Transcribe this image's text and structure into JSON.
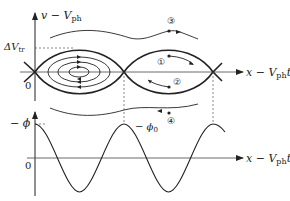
{
  "figure": {
    "type": "phase-space diagram with potential",
    "top_panel": {
      "y_axis_label": "v − V",
      "y_axis_label_sub": "ph",
      "x_axis_label": "x − V",
      "x_axis_label_sub": "ph",
      "x_axis_label_tail": "t",
      "trapping_width_label": "ΔV",
      "trapping_width_sub": "tr",
      "origin_label": "0",
      "trajectory_markers": [
        "①",
        "②",
        "③",
        "④"
      ]
    },
    "bottom_panel": {
      "y_axis_label": "− ϕ",
      "x_axis_label": "x − V",
      "x_axis_label_sub": "ph",
      "x_axis_label_tail": "t",
      "origin_label": "0",
      "minimum_label": "− ϕ",
      "minimum_label_sub": "0"
    },
    "colors": {
      "ink": "#222222",
      "guide": "#555555",
      "background": "#ffffff"
    }
  }
}
